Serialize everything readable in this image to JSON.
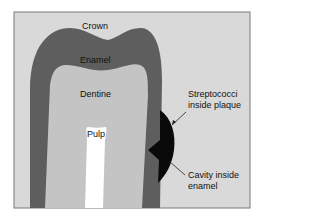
{
  "figure": {
    "labels": {
      "crown": "Crown",
      "enamel": "Enamel",
      "dentine": "Dentine",
      "pulp": "Pulp",
      "streptococci_line1": "Streptococci",
      "streptococci_line2": "inside plaque",
      "cavity_line1": "Cavity inside",
      "cavity_line2": "enamel"
    },
    "colors": {
      "background": "#d9d9d9",
      "enamel": "#5e5e5e",
      "dentine": "#c4c4c4",
      "pulp": "#ffffff",
      "plaque": "#0a0a0a",
      "border": "#7a7a7a"
    }
  }
}
